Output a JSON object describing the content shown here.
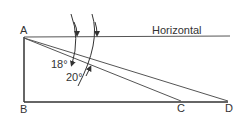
{
  "diagram": {
    "points": {
      "A": "A",
      "B": "B",
      "C": "C",
      "D": "D"
    },
    "horizontal_label": "Horizontal",
    "angles": [
      {
        "label": "18°",
        "to": "C"
      },
      {
        "label": "20°",
        "to": "D"
      }
    ],
    "colors": {
      "line": "#3a3a3a",
      "text": "#333333"
    }
  }
}
